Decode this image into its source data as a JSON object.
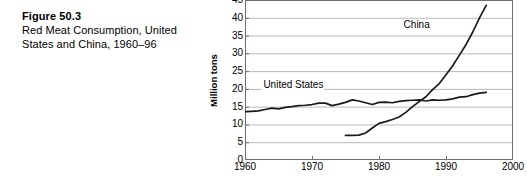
{
  "caption": {
    "figure_number": "Figure 50.3",
    "description": "Red Meat Consumption, United States and China, 1960–96"
  },
  "chart_data": {
    "type": "line",
    "title": "Red Meat Consumption, United States and China, 1960–96",
    "xlabel": "",
    "ylabel": "Million tons",
    "xlim": [
      1960,
      2000
    ],
    "ylim": [
      0,
      45
    ],
    "xticks": [
      1960,
      1970,
      1980,
      1990,
      2000
    ],
    "yticks": [
      0,
      5,
      10,
      15,
      20,
      25,
      30,
      35,
      40,
      45
    ],
    "grid": true,
    "legend_position": "inline-annotations",
    "line_color": "#1a1a1a",
    "grid_color": "#b9b9b9",
    "frame_color": "#6e6e6e",
    "series": [
      {
        "name": "United States",
        "label_x": 1962,
        "label_y": 21,
        "x": [
          1960,
          1961,
          1962,
          1963,
          1964,
          1965,
          1966,
          1967,
          1968,
          1969,
          1970,
          1971,
          1972,
          1973,
          1974,
          1975,
          1976,
          1977,
          1978,
          1979,
          1980,
          1981,
          1982,
          1983,
          1984,
          1985,
          1986,
          1987,
          1988,
          1989,
          1990,
          1991,
          1992,
          1993,
          1994,
          1995,
          1996
        ],
        "values": [
          13.6,
          13.7,
          13.8,
          14.2,
          14.6,
          14.4,
          14.8,
          15.0,
          15.3,
          15.4,
          15.6,
          16.0,
          16.0,
          15.3,
          15.7,
          16.2,
          16.9,
          16.6,
          16.1,
          15.6,
          16.2,
          16.3,
          16.1,
          16.5,
          16.7,
          16.8,
          16.9,
          16.6,
          16.9,
          16.8,
          16.9,
          17.2,
          17.7,
          17.8,
          18.4,
          18.8,
          19.0
        ]
      },
      {
        "name": "China",
        "label_x": 1988,
        "label_y": 38,
        "x": [
          1975,
          1976,
          1977,
          1978,
          1979,
          1980,
          1981,
          1982,
          1983,
          1984,
          1985,
          1986,
          1987,
          1988,
          1989,
          1990,
          1991,
          1992,
          1993,
          1994,
          1995,
          1996
        ],
        "values": [
          6.9,
          6.9,
          7.0,
          7.6,
          9.0,
          10.3,
          10.8,
          11.4,
          12.1,
          13.4,
          15.0,
          16.4,
          17.8,
          19.8,
          21.5,
          24.0,
          26.5,
          29.5,
          32.5,
          36.0,
          40.0,
          43.5
        ]
      }
    ]
  }
}
